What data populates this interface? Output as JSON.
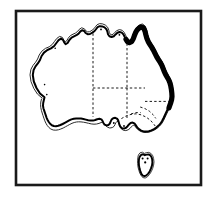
{
  "figure": {
    "kind": "outline-map",
    "frame": {
      "label": "figure-border",
      "x": 16,
      "y": 11,
      "width": 185,
      "height": 174,
      "color": "#1a1a1a"
    },
    "background_color": "#ffffff",
    "land_fill": "#ffffff",
    "coast_color": "#000000",
    "highlight_color": "#000000",
    "border_color": "#1a1a1a"
  },
  "regions": [
    {
      "id": "western-australia",
      "label": "Western Australia"
    },
    {
      "id": "northern-territory",
      "label": "Northern Territory"
    },
    {
      "id": "south-australia",
      "label": "South Australia"
    },
    {
      "id": "queensland",
      "label": "Queensland"
    },
    {
      "id": "new-south-wales",
      "label": "New South Wales"
    },
    {
      "id": "victoria",
      "label": "Victoria"
    },
    {
      "id": "tasmania",
      "label": "Tasmania"
    }
  ],
  "highlight": {
    "label": "East coast highlighted segment",
    "description": "Thick black line along the Queensland east coast from the Gulf of Carpentaria around Cape York down to the northern New South Wales border",
    "stroke_width_px": 5.2,
    "color": "#000000"
  },
  "geometry": {
    "mainland_coast": "M 44.5 97.2 L 40.0 93.5 L 36.5 88.0 L 33.8 81.5 L 32.8 75.0 L 33.6 70.0 L 35.5 66.4 L 38.0 63.2 L 40.0 60.0 L 41.6 56.0 L 44.0 52.6 L 47.4 50.0 L 51.0 48.4 L 54.2 46.0 L 56.4 43.0 L 58.6 40.2 L 61.0 38.6 L 63.0 39.8 L 64.2 42.4 L 65.6 44.2 L 67.6 43.0 L 69.4 40.0 L 71.6 37.6 L 74.0 36.4 L 76.4 35.2 L 78.6 33.6 L 80.2 31.6 L 82.0 30.2 L 84.2 31.0 L 85.6 33.0 L 87.6 34.2 L 90.0 34.0 L 92.4 32.6 L 94.6 31.0 L 96.2 29.0 L 97.6 27.2 L 99.8 26.2 L 102.2 26.4 L 104.6 27.4 L 106.4 29.2 L 107.4 31.6 L 108.0 34.2 L 109.4 36.2 L 111.6 37.0 L 113.8 36.2 L 115.6 34.4 L 117.4 32.8 L 119.6 32.0 L 121.8 32.6 L 123.4 34.4 L 124.6 36.8 L 125.8 39.4 L 127.4 41.6 L 129.4 42.6 L 131.6 41.6 L 133.2 39.0 L 134.4 35.6 L 135.8 32.2 L 137.6 29.4 L 139.8 27.6 L 142.0 27.0 L 143.8 28.4 L 145.0 31.2 L 145.8 34.6 L 146.8 38.2 L 148.2 41.6 L 150.0 44.6 L 151.8 47.4 L 153.4 50.2 L 155.0 53.4 L 156.6 56.6 L 158.4 59.6 L 160.2 62.4 L 161.8 65.2 L 163.0 68.2 L 164.2 71.4 L 165.6 74.4 L 167.2 77.2 L 168.8 80.0 L 170.0 83.0 L 170.8 86.2 L 171.4 89.6 L 171.8 93.0 L 172.0 96.4 L 171.6 99.8 L 170.6 103.0 L 169.2 106.0 L 167.8 109.0 L 166.4 112.0 L 165.0 115.0 L 163.6 118.0 L 162.2 120.8 L 160.6 123.4 L 158.6 125.6 L 156.4 127.6 L 154.0 129.2 L 151.4 130.4 L 148.8 131.2 L 146.2 131.6 L 143.6 131.4 L 141.2 130.6 L 139.0 129.2 L 137.2 127.4 L 135.8 125.2 L 134.4 123.4 L 132.6 122.6 L 130.6 123.0 L 129.0 124.4 L 127.6 126.2 L 126.0 127.8 L 124.0 128.6 L 122.0 128.2 L 120.4 126.8 L 119.4 124.8 L 118.8 122.6 L 118.2 120.4 L 117.0 118.6 L 115.2 117.8 L 113.2 118.2 L 111.6 119.6 L 110.6 121.6 L 109.8 123.6 L 108.4 125.0 L 106.4 125.4 L 104.6 124.6 L 103.4 123.0 L 102.6 121.0 L 101.4 119.4 L 99.4 118.8 L 97.2 119.2 L 95.2 120.0 L 93.0 120.6 L 90.6 120.6 L 88.2 120.2 L 85.8 119.6 L 83.4 119.0 L 81.0 118.6 L 78.6 118.4 L 76.2 118.4 L 73.8 118.8 L 71.4 119.4 L 69.2 120.4 L 67.0 121.6 L 64.8 122.8 L 62.6 124.0 L 60.4 125.0 L 58.2 125.8 L 56.0 126.2 L 53.8 126.0 L 51.8 125.2 L 50.2 123.8 L 48.8 122.0 L 47.6 120.0 L 46.6 117.8 L 45.8 115.4 L 45.0 113.0 L 44.2 110.6 L 43.4 108.2 L 43.0 105.6 L 43.2 103.0 L 43.8 100.2 Z",
    "coast_halo": "M 42.0 98.0 L 37.4 94.0 L 33.8 88.4 L 31.0 81.6 L 30.0 74.8 L 30.9 69.4 L 33.0 65.4 L 35.6 62.2 L 37.6 59.0 L 39.2 55.0 L 41.8 51.2 L 45.4 48.4 L 49.2 46.8 L 52.3 44.4 L 54.5 41.4 L 56.8 38.4 L 59.6 36.4 L 62.4 37.4 L 63.9 40.2 L 65.2 41.8 L 66.6 41.0 L 68.2 38.2 L 70.4 35.6 L 73.0 34.2 L 75.5 33.0 L 77.6 31.4 L 79.2 29.4 L 81.6 27.8 L 84.4 28.8 L 85.9 30.9 L 87.7 31.9 L 89.7 31.7 L 92.0 30.3 L 94.0 28.7 L 95.4 26.8 L 97.0 24.8 L 99.6 23.6 L 102.6 23.9 L 105.4 25.1 L 107.6 27.2 L 108.8 30.1 L 109.4 32.8 L 110.5 34.4 L 111.9 34.8 L 113.4 34.0 L 115.0 32.2 L 116.9 30.6 L 119.4 29.6 L 122.2 30.3 L 124.2 32.4 L 125.6 35.2 L 126.8 37.9 L 128.2 39.7 L 129.5 40.3 L 131.0 39.5 L 132.2 37.2 L 133.4 33.8 L 134.9 30.2 L 136.9 27.0 L 139.5 24.8 L 142.4 24.0 L 144.9 25.8 L 146.4 29.2 L 147.2 32.9 L 148.1 36.4 L 149.4 39.7 L 151.1 42.6 L 152.9 45.4 L 154.5 48.2 L 156.1 51.4 L 157.7 54.6 L 159.5 57.6 L 161.3 60.4 L 162.9 63.2 L 164.1 66.2 L 165.3 69.4 L 166.7 72.4 L 168.3 75.2 L 169.9 78.0 L 171.2 81.2 L 172.1 84.6 L 172.8 88.2 L 173.3 91.8 L 173.5 95.4 L 173.1 99.2 L 172.0 102.6 L 170.5 105.8 L 169.0 108.9 L 167.6 111.9 L 166.2 114.9 L 164.8 117.9 L 163.4 120.8 L 161.7 123.6 L 159.6 126.0 L 157.2 128.2 L 154.6 129.9 L 151.8 131.2 L 149.0 132.1 L 146.2 132.5 L 143.3 132.3 L 140.6 131.4 L 138.2 129.8 L 136.2 127.8 L 134.8 125.8 L 133.8 125.2 L 132.6 125.6 L 131.4 126.8 L 130.0 128.4 L 128.2 129.8 L 125.8 130.6 L 123.2 130.2 L 121.2 128.6 L 120.0 126.4 L 119.4 124.0 L 118.8 122.2 L 118.0 121.4 L 116.8 121.6 L 115.8 122.8 L 115.0 124.6 L 114.0 126.4 L 112.2 127.6 L 109.8 128.0 L 107.4 127.2 L 105.6 125.4 L 104.6 123.4 L 103.8 122.2 L 102.6 122.0 L 101.0 122.6 L 99.0 123.4 L 96.6 124.0 L 94.0 124.2 L 91.2 123.9 L 88.6 123.3 L 86.0 122.7 L 83.4 122.2 L 81.0 121.9 L 78.6 121.8 L 76.4 122.0 L 74.2 122.5 L 72.0 123.3 L 69.8 124.4 L 67.6 125.6 L 65.4 126.8 L 63.2 128.0 L 60.8 129.0 L 58.4 129.8 L 55.8 130.2 L 53.2 130.0 L 50.8 129.0 L 48.8 127.4 L 47.2 125.4 L 45.9 123.2 L 44.8 120.8 L 43.9 118.2 L 43.0 115.6 L 42.2 113.0 L 41.4 110.4 L 40.8 107.6 L 40.6 104.8 L 40.8 102.0 L 41.4 99.4 Z",
    "east_coast_highlight": "M 126.0 39.4 L 127.4 41.6 L 129.4 42.6 L 131.6 41.6 L 133.2 39.0 L 134.4 35.6 L 135.8 32.2 L 137.6 29.4 L 139.8 27.6 L 142.0 27.0 L 143.8 28.4 L 145.0 31.2 L 145.8 34.6 L 146.8 38.2 L 148.2 41.6 L 150.0 44.6 L 151.8 47.4 L 153.4 50.2 L 155.0 53.4 L 156.6 56.6 L 158.4 59.6 L 160.2 62.4 L 161.8 65.2 L 163.0 68.2 L 164.2 71.4 L 165.6 74.4 L 167.2 77.2 L 168.8 80.0 L 170.0 83.0 L 170.8 86.2 L 171.4 89.6 L 171.8 93.0 L 172.0 96.4 L 171.6 99.8 L 170.8 102.6 L 169.8 105.4 L 169.0 107.8",
    "gulf_detail": "M 119.6 32.0 L 121.8 32.6 L 123.4 34.4 L 124.6 36.8 L 126.0 39.4",
    "state_border_wa_nt_sa": "M 93.0 33.4 L 93.0 116.8",
    "state_border_nt_qld": "M 127.0 43.4 L 127.0 88.0",
    "state_border_nt_sa_horizontal": "M 93.0 88.0 L 145.0 88.0",
    "state_border_sa_nsw_horizontal": "M 127.0 101.4 L 168.0 101.4",
    "state_border_sa_east": "M 127.0 88.0 L 127.0 118.6",
    "state_border_qld_nsw": "M 145.0 101.4 L 168.6 101.4",
    "state_border_nsw_vic": "M 121.4 118.6 L 126.0 116.0 L 131.0 114.4 L 136.0 113.8 L 141.0 114.8 L 146.0 117.0 L 150.6 120.4 L 154.0 124.4 L 156.6 128.0",
    "tasmania_halo": "M 138.4 155.0 L 140.0 152.8 L 142.4 152.2 L 144.4 153.4 L 146.4 152.6 L 148.8 152.4 L 151.2 153.6 L 152.8 155.8 L 153.6 158.6 L 154.0 161.8 L 153.6 165.2 L 152.6 168.6 L 151.2 171.8 L 149.4 174.6 L 147.4 176.8 L 145.2 178.0 L 143.0 177.6 L 141.2 175.8 L 139.8 173.2 L 138.8 170.2 L 138.0 167.0 L 137.6 163.6 L 137.6 160.2 L 137.8 157.4 Z",
    "tasmania": "M 140.0 156.4 L 141.4 154.6 L 143.2 154.2 L 144.8 155.2 L 146.6 154.6 L 148.6 154.4 L 150.4 155.4 L 151.6 157.2 L 152.2 159.6 L 152.4 162.4 L 152.0 165.4 L 151.0 168.4 L 149.8 171.2 L 148.2 173.6 L 146.4 175.4 L 144.6 176.2 L 142.8 175.6 L 141.4 173.8 L 140.4 171.4 L 139.6 168.6 L 139.0 165.6 L 138.8 162.6 L 138.9 159.8 L 139.3 157.6 Z",
    "tasmania_dots": [
      {
        "cx": 142.6,
        "cy": 158.6,
        "r": 1.0
      },
      {
        "cx": 147.6,
        "cy": 158.6,
        "r": 1.0
      },
      {
        "cx": 145.2,
        "cy": 162.4,
        "r": 1.1
      }
    ],
    "coastal_dots": [
      {
        "cx": 101.0,
        "cy": 29.4,
        "r": 0.9
      },
      {
        "cx": 119.4,
        "cy": 34.8,
        "r": 0.9
      },
      {
        "cx": 55.2,
        "cy": 48.2,
        "r": 0.8
      },
      {
        "cx": 44.6,
        "cy": 84.6,
        "r": 0.8
      },
      {
        "cx": 46.8,
        "cy": 94.6,
        "r": 0.8
      },
      {
        "cx": 113.8,
        "cy": 123.0,
        "r": 0.9
      },
      {
        "cx": 124.0,
        "cy": 126.0,
        "r": 0.9
      }
    ],
    "inland_dashes": [
      "M 140.2 107.0 L 145.0 108.6 L 149.4 111.2 L 153.0 114.6 L 155.8 118.4",
      "M 131.0 114.0 L 135.6 112.6 L 140.6 112.6"
    ]
  }
}
